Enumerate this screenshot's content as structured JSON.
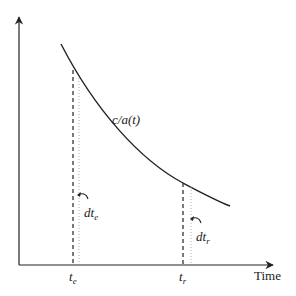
{
  "diagram": {
    "curve_label": "c/a(t)",
    "x_axis_label": "Time",
    "markers": [
      {
        "name": "te",
        "base": "t",
        "sub": "e",
        "interval_base": "dt",
        "interval_sub": "e"
      },
      {
        "name": "tr",
        "base": "t",
        "sub": "r",
        "interval_base": "dt",
        "interval_sub": "r"
      }
    ],
    "colors": {
      "line": "#222222",
      "dotted": "#888888",
      "background": "#ffffff"
    }
  }
}
